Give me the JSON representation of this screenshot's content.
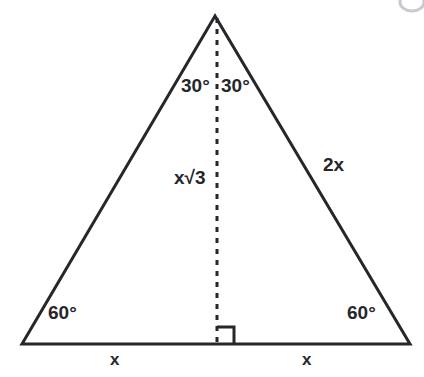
{
  "figure": {
    "type": "geometric-diagram",
    "shape": "equilateral-triangle-with-altitude",
    "background_color": "#ffffff",
    "stroke_color": "#27272b",
    "text_color": "#27272b",
    "artifact_color": "#c9c9cf",
    "vertices": {
      "apex": [
        215,
        16
      ],
      "bottom_left": [
        22,
        344
      ],
      "bottom_right": [
        410,
        344
      ],
      "altitude_foot": [
        217,
        344
      ]
    },
    "altitude": {
      "style": "dashed",
      "dash_length": 5,
      "gap_length": 6,
      "stroke_width": 3
    },
    "right_angle_marker": {
      "size": 17,
      "opens": "right"
    },
    "labels": {
      "angle_apex_left": "30°",
      "angle_apex_right": "30°",
      "angle_base_left": "60°",
      "angle_base_right": "60°",
      "altitude": "x√3",
      "side_right": "2x",
      "base_left": "x",
      "base_right": "x"
    }
  }
}
